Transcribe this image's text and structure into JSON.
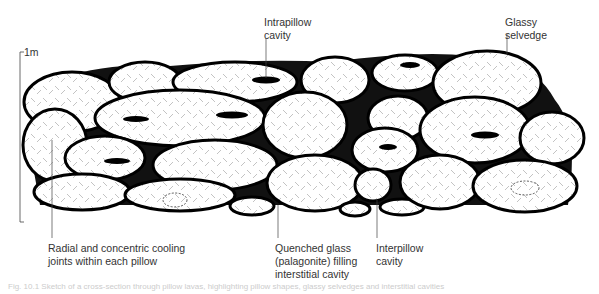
{
  "diagram": {
    "scale_bar": {
      "label": "1m"
    },
    "labels": {
      "intrapillow": "Intrapillow\ncavity",
      "selvedge": "Glassy\nselvedge",
      "radial": "Radial and concentric cooling\njoints within each pillow",
      "quenched": "Quenched glass\n(palagonite) filling\ninterstitial cavity",
      "interpillow": "Interpillow\ncavity"
    },
    "caption": "Fig. 10.1  Sketch of a cross-section through pillow lavas, highlighting pillow shapes, glassy selvedges and interstitial cavities"
  }
}
